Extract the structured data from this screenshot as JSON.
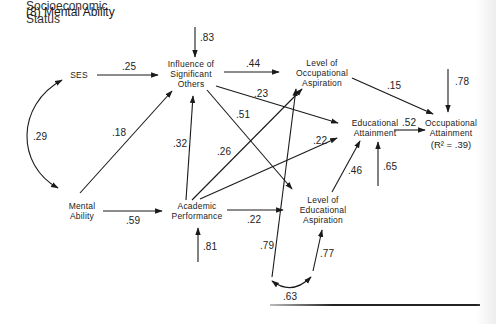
{
  "caption": {
    "prev_line": "(7) Socioeconomic Status",
    "label": "(8)  Mental Ability"
  },
  "nodes": {
    "ses": [
      "SES"
    ],
    "iso": [
      "Influence of",
      "Significant",
      "Others"
    ],
    "loa": [
      "Level of",
      "Occupational",
      "Aspiration"
    ],
    "ea": [
      "Educational",
      "Attainment"
    ],
    "oa": [
      "Occupational",
      "Attainment"
    ],
    "oa_r2": "(R² = .39)",
    "ma": [
      "Mental",
      "Ability"
    ],
    "ap": [
      "Academic",
      "Performance"
    ],
    "lea": [
      "Level of",
      "Educational",
      "Aspiration"
    ]
  },
  "coefficients": {
    "ses_iso": ".25",
    "iso_residual": ".83",
    "iso_loa": ".44",
    "iso_ea": ".23",
    "iso_lea": ".51",
    "loa_oa": ".15",
    "oa_residual": ".78",
    "ea_oa": ".52",
    "ses_ma_corr": ".29",
    "ma_iso": ".18",
    "ap_iso": ".32",
    "ap_loa": ".26",
    "ap_ea": ".22",
    "lea_ea": ".46",
    "ea_residual": ".65",
    "ma_ap": ".59",
    "ap_lea": ".22",
    "ap_residual": ".81",
    "loa_residual": ".79",
    "lea_residual": ".77",
    "residual_corr": ".63"
  }
}
